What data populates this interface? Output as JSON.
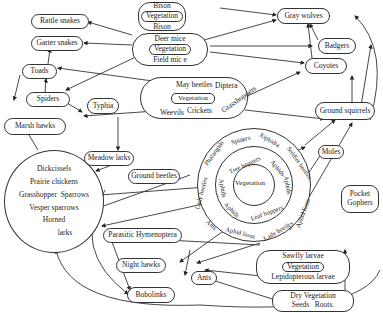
{
  "diagram": {
    "type": "food-web",
    "nodes": {
      "rattle_snakes": "Rattle snakes",
      "garter_snakes": "Garter snakes",
      "toads": "Toads",
      "spiders": "Spiders",
      "marsh_hawks": "Marsh hawks",
      "typhia": "Typhia",
      "meadow_larks": "Meadow larks",
      "ground_beetles": "Ground beetles",
      "parasitic_hymenoptera": "Parasitic Hymenoptera",
      "night_hawks": "Night hawks",
      "bobolinks": "Bobolinks",
      "ants": "Ants",
      "gray_wolves": "Gray wolves",
      "badgers": "Badgers",
      "coyotes": "Coyotes",
      "ground_squirrels": "Ground squirrels",
      "moles": "Moles",
      "pocket_gophers_1": "Pocket",
      "pocket_gophers_2": "Gophers"
    },
    "bison_group": {
      "top": "Bison",
      "center": "Vegetation",
      "bottom": "Bison"
    },
    "mice_group": {
      "top": "Deer mice",
      "center": "Vegetation",
      "bottom": "Field mic e"
    },
    "insect_group": {
      "top_left": "May beetles",
      "top_right": "Diptera",
      "center": "Vegetation",
      "bottom": [
        "Weevils",
        "Crickets",
        "Grasshoppers"
      ]
    },
    "bird_group": [
      "Dickcissels",
      "Prairie chickens",
      "Grasshopper",
      "Sparrows",
      "Vesper sparrows",
      "Horned",
      "larks"
    ],
    "circle_group": {
      "center": "Vegetation",
      "inner_ring": [
        "Tree hoppers",
        "Aphids",
        "Aphids",
        "Leaf hoppers",
        "Aphids",
        "Aphids"
      ],
      "outer_ring": [
        "Spiders",
        "Xiphidia",
        "Soldier beetles",
        "Aphid lions",
        "Lady beetles",
        "Aphid lions",
        "Ants",
        "Lady beetles",
        "Phalangids"
      ]
    },
    "sawfly_group": {
      "top": "Sawfly larvae",
      "center": "Vegetation",
      "bottom": "Lepidopterous larvae"
    },
    "dry_group": {
      "line1": "Dry Vegetation",
      "seeds": "Seeds",
      "roots": "Roots."
    }
  }
}
